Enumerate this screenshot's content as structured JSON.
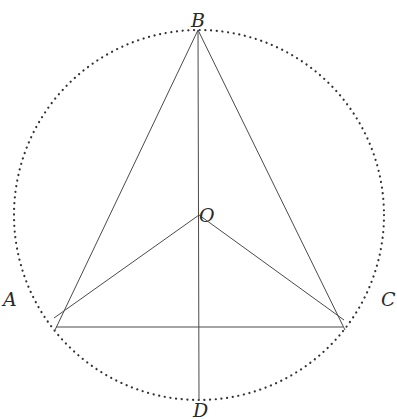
{
  "diagram": {
    "title": "",
    "circle": {
      "cx": 199,
      "cy": 215,
      "r": 185,
      "style": "dotted",
      "color": "#333333"
    },
    "points": {
      "A": {
        "x": 56,
        "y": 327,
        "label": "A"
      },
      "B": {
        "x": 198,
        "y": 30,
        "label": "B"
      },
      "C": {
        "x": 343,
        "y": 327,
        "label": "C"
      },
      "D": {
        "x": 199,
        "y": 400,
        "label": "D"
      },
      "O": {
        "x": 199,
        "y": 215,
        "label": "O"
      }
    },
    "segments": [
      {
        "from": "B",
        "to": "A"
      },
      {
        "from": "B",
        "to": "C"
      },
      {
        "from": "A",
        "to": "C"
      },
      {
        "from": "O",
        "to": "A"
      },
      {
        "from": "O",
        "to": "C"
      },
      {
        "from": "B",
        "to": "D"
      }
    ],
    "labels": {
      "A": "A",
      "B": "B",
      "C": "C",
      "D": "D",
      "O": "O"
    },
    "line_color": "#4a4a4a"
  }
}
